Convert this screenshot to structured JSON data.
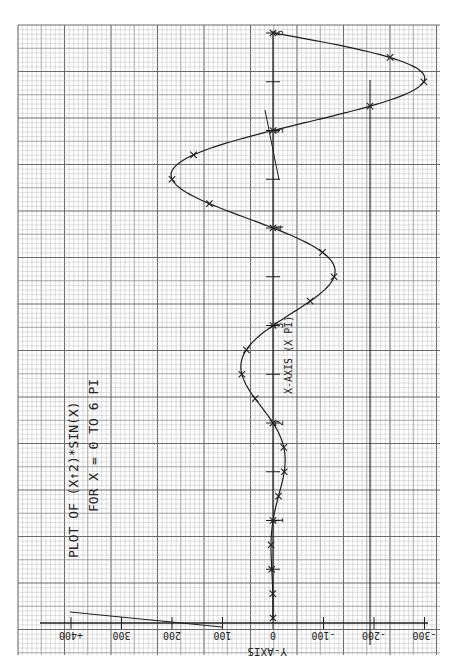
{
  "title": {
    "line1": "PLOT OF (X↑2)*SIN(X)",
    "line2": "FOR X = 0 TO 6 PI"
  },
  "axes": {
    "x_label": "X-AXIS (X PI)",
    "y_label": "Y-AXIS"
  },
  "colors": {
    "paper": "#ffffff",
    "grid_minor": "#b5b5b5",
    "grid_major": "#6a6a6a",
    "ink": "#1e1e1e"
  },
  "chart_data": {
    "type": "line",
    "title": "PLOT OF (X↑2)*SIN(X) FOR X = 0 TO 6 PI",
    "xlabel": "X-AXIS (X PI)",
    "ylabel": "Y-AXIS",
    "orientation": "rotated 90°: x runs bottom-to-top, y runs right-to-left",
    "x_ticks": [
      1,
      2,
      3,
      4,
      5,
      6
    ],
    "y_ticks": [
      "+400",
      "300",
      "200",
      "100",
      "0",
      "-100",
      "-200",
      "-300"
    ],
    "y_tick_values": [
      400,
      300,
      200,
      100,
      0,
      -100,
      -200,
      -300
    ],
    "xlim": [
      0,
      6
    ],
    "ylim": [
      -300,
      400
    ],
    "grid": true,
    "marker": "x",
    "x": [
      0,
      0.25,
      0.5,
      0.75,
      1.0,
      1.25,
      1.5,
      1.75,
      2.0,
      2.25,
      2.5,
      2.75,
      3.0,
      3.25,
      3.5,
      3.75,
      4.0,
      4.25,
      4.5,
      4.75,
      5.0,
      5.25,
      5.5,
      5.75,
      6.0
    ],
    "values": [
      0,
      0.4,
      2.5,
      3.9,
      0,
      -10.9,
      -22.2,
      -21.4,
      0,
      35.3,
      61.7,
      52.7,
      0,
      -73.7,
      -120.9,
      -98.1,
      0,
      126.0,
      199.9,
      157.4,
      0,
      -192.2,
      -298.6,
      -231.8,
      0
    ]
  },
  "annotations": {
    "extra_lines": "hand-drawn guide strokes near y=+400..100 and near y=-200; small slanted stroke near x=5"
  }
}
